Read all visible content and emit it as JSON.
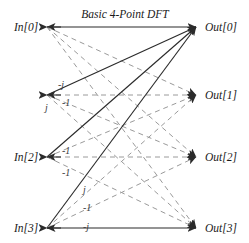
{
  "figure": {
    "title": "Basic 4-Point DFT",
    "title_x": 125,
    "title_y": 15,
    "width": 249,
    "height": 243,
    "background": "#ffffff",
    "solid_color": "#2b2b2b",
    "dashed_color": "#9a9a9a",
    "text_color": "#1a1a1a"
  },
  "inputs": [
    {
      "label": "In[0]",
      "x": 47,
      "y": 27,
      "label_x": 14,
      "label_y": 22
    },
    {
      "label": "",
      "x": 47,
      "y": 95,
      "label_x": 14,
      "label_y": 90
    },
    {
      "label": "In[2]",
      "x": 47,
      "y": 157,
      "label_x": 14,
      "label_y": 152
    },
    {
      "label": "In[3]",
      "x": 47,
      "y": 228,
      "label_x": 14,
      "label_y": 223
    }
  ],
  "outputs": [
    {
      "label": "Out[0]",
      "x": 196,
      "y": 27,
      "label_x": 205,
      "label_y": 22
    },
    {
      "label": "Out[1]",
      "x": 196,
      "y": 95,
      "label_x": 205,
      "label_y": 90
    },
    {
      "label": "Out[2]",
      "x": 196,
      "y": 157,
      "label_x": 205,
      "label_y": 152
    },
    {
      "label": "Out[3]",
      "x": 196,
      "y": 228,
      "label_x": 205,
      "label_y": 223
    }
  ],
  "edges": [
    {
      "from": 0,
      "to": 0,
      "style": "solid",
      "dir": "both"
    },
    {
      "from": 0,
      "to": 1,
      "style": "dashed",
      "dir": "right"
    },
    {
      "from": 0,
      "to": 2,
      "style": "dashed",
      "dir": "right"
    },
    {
      "from": 0,
      "to": 3,
      "style": "dashed",
      "dir": "right"
    },
    {
      "from": 1,
      "to": 0,
      "style": "solid",
      "dir": "right"
    },
    {
      "from": 1,
      "to": 1,
      "style": "dashed",
      "dir": "both"
    },
    {
      "from": 1,
      "to": 2,
      "style": "dashed",
      "dir": "right"
    },
    {
      "from": 1,
      "to": 3,
      "style": "dashed",
      "dir": "right"
    },
    {
      "from": 2,
      "to": 0,
      "style": "solid",
      "dir": "right"
    },
    {
      "from": 2,
      "to": 1,
      "style": "dashed",
      "dir": "right"
    },
    {
      "from": 2,
      "to": 2,
      "style": "dashed",
      "dir": "both"
    },
    {
      "from": 2,
      "to": 3,
      "style": "dashed",
      "dir": "right"
    },
    {
      "from": 3,
      "to": 0,
      "style": "solid",
      "dir": "right"
    },
    {
      "from": 3,
      "to": 1,
      "style": "dashed",
      "dir": "right"
    },
    {
      "from": 3,
      "to": 2,
      "style": "dashed",
      "dir": "right"
    },
    {
      "from": 3,
      "to": 3,
      "style": "solid",
      "dir": "both"
    }
  ],
  "edge_labels": [
    {
      "text": "-j",
      "x": 58,
      "y": 80
    },
    {
      "text": "-1",
      "x": 62,
      "y": 98
    },
    {
      "text": "j",
      "x": 45,
      "y": 103
    },
    {
      "text": "-1",
      "x": 62,
      "y": 146
    },
    {
      "text": "-1",
      "x": 62,
      "y": 168
    },
    {
      "text": "j",
      "x": 83,
      "y": 185
    },
    {
      "text": "-1",
      "x": 83,
      "y": 203
    },
    {
      "text": "-j",
      "x": 83,
      "y": 222
    }
  ]
}
